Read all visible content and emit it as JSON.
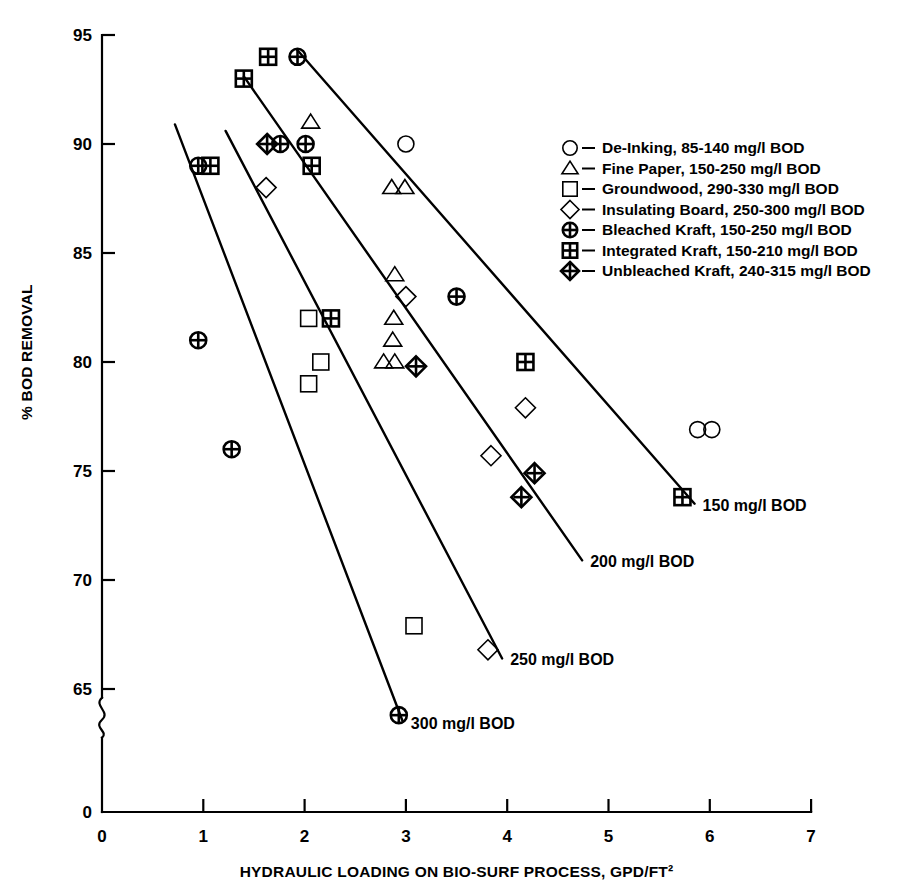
{
  "chart_data": {
    "type": "scatter",
    "title": "",
    "xlabel": "HYDRAULIC LOADING ON BIO-SURF PROCESS, GPD/FT²",
    "ylabel": "% BOD REMOVAL",
    "xlim": [
      0,
      7
    ],
    "ylim": [
      63,
      95
    ],
    "y_axis_break": true,
    "y_break_label": "0",
    "grid": false,
    "legend_position": "upper-right",
    "xticks": [
      "0",
      "1",
      "2",
      "3",
      "4",
      "5",
      "6",
      "7"
    ],
    "yticks": [
      "95",
      "90",
      "85",
      "80",
      "75",
      "70",
      "65",
      "0"
    ],
    "series": [
      {
        "name": "De-Inking, 85-140 mg/l BOD",
        "short_name": "De-Inking",
        "marker": "circle",
        "bod_range": "85-140 mg/l BOD",
        "points": [
          [
            3.0,
            90.0
          ],
          [
            5.88,
            76.9
          ],
          [
            6.02,
            76.9
          ]
        ]
      },
      {
        "name": "Fine Paper, 150-250 mg/l BOD",
        "short_name": "Fine Paper",
        "marker": "triangle",
        "bod_range": "150-250 mg/l BOD",
        "points": [
          [
            2.06,
            91.0
          ],
          [
            2.86,
            88.0
          ],
          [
            2.99,
            88.0
          ],
          [
            2.89,
            84.0
          ],
          [
            2.88,
            82.0
          ],
          [
            2.87,
            81.0
          ],
          [
            2.78,
            80.0
          ],
          [
            2.89,
            80.0
          ]
        ]
      },
      {
        "name": "Groundwood, 290-330 mg/l BOD",
        "short_name": "Groundwood",
        "marker": "square",
        "bod_range": "290-330 mg/l BOD",
        "points": [
          [
            2.04,
            82.0
          ],
          [
            2.16,
            80.0
          ],
          [
            2.04,
            79.0
          ],
          [
            3.08,
            67.9
          ]
        ]
      },
      {
        "name": "Insulating Board, 250-300 mg/l BOD",
        "short_name": "Insulating Board",
        "marker": "diamond",
        "bod_range": "250-300 mg/l BOD",
        "points": [
          [
            1.62,
            88.0
          ],
          [
            3.0,
            83.0
          ],
          [
            4.18,
            77.9
          ],
          [
            3.84,
            75.7
          ],
          [
            3.81,
            66.8
          ]
        ]
      },
      {
        "name": "Bleached Kraft, 150-250 mg/l BOD",
        "short_name": "Bleached Kraft",
        "marker": "circle-cross",
        "bod_range": "150-250 mg/l BOD",
        "points": [
          [
            1.93,
            94.0
          ],
          [
            0.95,
            89.0
          ],
          [
            1.76,
            90.0
          ],
          [
            2.01,
            90.0
          ],
          [
            3.5,
            83.0
          ],
          [
            0.95,
            81.0
          ],
          [
            1.28,
            76.0
          ],
          [
            2.93,
            63.8
          ]
        ]
      },
      {
        "name": "Integrated Kraft, 150-210 mg/l BOD",
        "short_name": "Integrated Kraft",
        "marker": "square-cross",
        "bod_range": "150-210 mg/l BOD",
        "points": [
          [
            1.64,
            94.0
          ],
          [
            1.4,
            93.0
          ],
          [
            1.07,
            89.0
          ],
          [
            2.07,
            89.0
          ],
          [
            2.26,
            82.0
          ],
          [
            4.18,
            80.0
          ],
          [
            5.73,
            73.8
          ]
        ]
      },
      {
        "name": "Unbleached Kraft, 240-315 mg/l BOD",
        "short_name": "Unbleached Kraft",
        "marker": "diamond-cross",
        "bod_range": "240-315 mg/l BOD",
        "points": [
          [
            1.63,
            90.0
          ],
          [
            3.1,
            79.8
          ],
          [
            4.27,
            74.9
          ],
          [
            4.14,
            73.8
          ]
        ]
      }
    ],
    "trend_lines": [
      {
        "label": "150 mg/l BOD",
        "x": [
          1.93,
          5.85
        ],
        "y": [
          94.3,
          73.5
        ]
      },
      {
        "label": "200 mg/l BOD",
        "x": [
          1.4,
          4.74
        ],
        "y": [
          93.1,
          70.9
        ]
      },
      {
        "label": "250 mg/l BOD",
        "x": [
          1.22,
          3.95
        ],
        "y": [
          90.6,
          66.4
        ]
      },
      {
        "label": "300 mg/l BOD",
        "x": [
          0.72,
          2.97
        ],
        "y": [
          90.9,
          63.5
        ]
      }
    ],
    "legend": [
      {
        "marker": "circle",
        "label": "De-Inking, 85-140 mg/l BOD"
      },
      {
        "marker": "triangle",
        "label": "Fine Paper, 150-250 mg/l BOD"
      },
      {
        "marker": "square",
        "label": "Groundwood, 290-330 mg/l BOD"
      },
      {
        "marker": "diamond",
        "label": "Insulating Board, 250-300 mg/l BOD"
      },
      {
        "marker": "circle-cross",
        "label": "Bleached Kraft, 150-250 mg/l BOD"
      },
      {
        "marker": "square-cross",
        "label": "Integrated Kraft, 150-210 mg/l BOD"
      },
      {
        "marker": "diamond-cross",
        "label": "Unbleached Kraft, 240-315 mg/l BOD"
      }
    ],
    "colors": {
      "ink": "#000000",
      "background": "#ffffff"
    }
  }
}
